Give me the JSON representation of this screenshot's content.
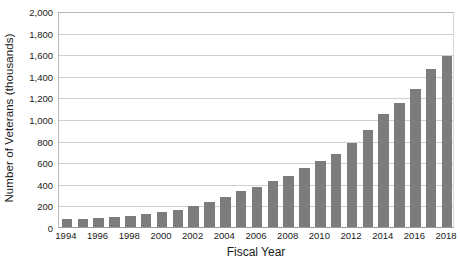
{
  "chart_data": {
    "type": "bar",
    "title": "",
    "xlabel": "Fiscal Year",
    "ylabel": "Number of Veterans (thousands)",
    "ylim": [
      0,
      2000
    ],
    "ytick_step": 200,
    "grid": true,
    "legend": "none",
    "bar_color": "#7c7c7c",
    "grid_color": "#cfcfcf",
    "categories": [
      "1994",
      "1995",
      "1996",
      "1997",
      "1998",
      "1999",
      "2000",
      "2001",
      "2002",
      "2003",
      "2004",
      "2005",
      "2006",
      "2007",
      "2008",
      "2009",
      "2010",
      "2011",
      "2012",
      "2013",
      "2014",
      "2015",
      "2016",
      "2017",
      "2018"
    ],
    "values": [
      70,
      75,
      80,
      90,
      105,
      125,
      140,
      155,
      190,
      230,
      280,
      330,
      375,
      430,
      475,
      545,
      610,
      680,
      780,
      900,
      1050,
      1150,
      1280,
      1460,
      1580
    ],
    "ytick_labels": [
      "2,000",
      "1,800",
      "1,600",
      "1,400",
      "1,200",
      "1,000",
      "800",
      "600",
      "400",
      "200",
      "0"
    ],
    "ytick_values": [
      2000,
      1800,
      1600,
      1400,
      1200,
      1000,
      800,
      600,
      400,
      200,
      0
    ],
    "xtick_labels": [
      "1994",
      "1996",
      "1998",
      "2000",
      "2002",
      "2004",
      "2006",
      "2008",
      "2010",
      "2012",
      "2014",
      "2016",
      "2018"
    ]
  }
}
